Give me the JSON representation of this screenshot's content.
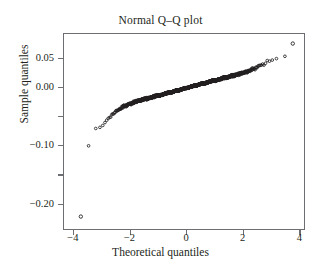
{
  "chart_data": {
    "type": "scatter",
    "title": "Normal Q–Q plot",
    "xlabel": "Theoretical quantiles",
    "ylabel": "Sample quantiles",
    "xlim": [
      -4.35,
      4.2
    ],
    "ylim": [
      -0.245,
      0.092
    ],
    "grid": false,
    "legend": null,
    "marker": "open-circle",
    "marker_color": "#231f20",
    "xticks": [
      -4,
      -2,
      0,
      2,
      4
    ],
    "xtick_labels": [
      "−4",
      "−2",
      "0",
      "2",
      "4"
    ],
    "yticks": [
      0.05,
      0.0,
      -0.1,
      -0.2
    ],
    "ytick_labels": [
      "0.05",
      "0.00",
      "−0.10",
      "−0.20"
    ],
    "yticks_minor": [
      -0.05,
      -0.15
    ],
    "n_points": 2400,
    "outliers": [
      {
        "x": -3.75,
        "y": -0.2235,
        "label": "lower-extreme-outlier"
      },
      {
        "x": 3.8,
        "y": 0.0755,
        "label": "upper-extreme-outlier"
      }
    ],
    "curve_control_points": [
      {
        "x": -3.75,
        "y": -0.2235
      },
      {
        "x": -3.42,
        "y": -0.0905
      },
      {
        "x": -3.3,
        "y": -0.0765
      },
      {
        "x": -3.2,
        "y": -0.0735
      },
      {
        "x": -3.05,
        "y": -0.0695
      },
      {
        "x": -2.9,
        "y": -0.0615
      },
      {
        "x": -2.75,
        "y": -0.0525
      },
      {
        "x": -2.6,
        "y": -0.0455
      },
      {
        "x": -2.4,
        "y": -0.0385
      },
      {
        "x": -2.2,
        "y": -0.0325
      },
      {
        "x": -2.0,
        "y": -0.0285
      },
      {
        "x": -1.7,
        "y": -0.0235
      },
      {
        "x": -1.4,
        "y": -0.0195
      },
      {
        "x": -1.0,
        "y": -0.0145
      },
      {
        "x": -0.6,
        "y": -0.0095
      },
      {
        "x": -0.3,
        "y": -0.0055
      },
      {
        "x": 0.0,
        "y": -0.0015
      },
      {
        "x": 0.3,
        "y": 0.0025
      },
      {
        "x": 0.6,
        "y": 0.0065
      },
      {
        "x": 1.0,
        "y": 0.0115
      },
      {
        "x": 1.4,
        "y": 0.0165
      },
      {
        "x": 1.7,
        "y": 0.0205
      },
      {
        "x": 2.0,
        "y": 0.0245
      },
      {
        "x": 2.2,
        "y": 0.0275
      },
      {
        "x": 2.4,
        "y": 0.0315
      },
      {
        "x": 2.6,
        "y": 0.0365
      },
      {
        "x": 2.75,
        "y": 0.0405
      },
      {
        "x": 2.9,
        "y": 0.0445
      },
      {
        "x": 3.0,
        "y": 0.0475
      },
      {
        "x": 3.12,
        "y": 0.0505
      },
      {
        "x": 3.25,
        "y": 0.0498
      },
      {
        "x": 3.38,
        "y": 0.0515
      },
      {
        "x": 3.5,
        "y": 0.0525
      }
    ]
  }
}
